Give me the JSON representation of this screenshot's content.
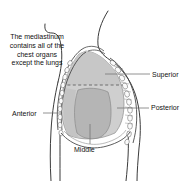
{
  "figure": {
    "width": 186,
    "height": 181,
    "background": "#ffffff"
  },
  "caption": {
    "text": "The mediastinum contains all of the chest organs except the lungs"
  },
  "labels": [
    {
      "id": "superior",
      "text": "Superior"
    },
    {
      "id": "posterior",
      "text": "Posterior"
    },
    {
      "id": "anterior",
      "text": "Anterior"
    },
    {
      "id": "middle",
      "text": "Middle"
    }
  ],
  "colors": {
    "outline": "#3b3b3b",
    "leader_line": "#777777",
    "mediastinum_light": "#cfcfcf",
    "mediastinum_middle": "#b5b5b5",
    "mediastinum_superior": "#c7c7c7",
    "rib_fill": "#fbfbfb",
    "rib_stroke": "#6d6d6d",
    "text": "#111111",
    "dashed_divider": "#555555"
  },
  "illustration": {
    "view": "sagittal-thorax",
    "parts": [
      "body-outline",
      "neck-outline",
      "shoulder-outline",
      "rib-cage-anterior",
      "rib-cage-posterior",
      "sternum",
      "diaphragm",
      "mediastinum-superior",
      "mediastinum-anterior",
      "mediastinum-middle",
      "mediastinum-posterior",
      "superior-inferior-divider-dashed"
    ]
  }
}
